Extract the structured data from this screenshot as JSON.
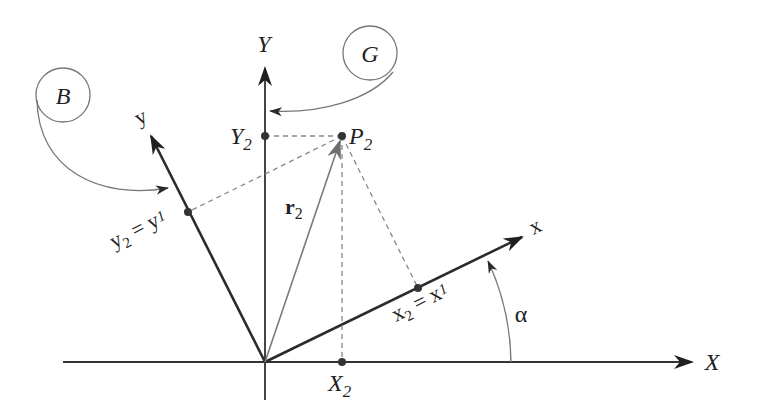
{
  "diagram": {
    "type": "rotated-coordinate-frames",
    "frames": {
      "global": {
        "label": "G",
        "x_axis": "X",
        "y_axis": "Y"
      },
      "body": {
        "label": "B",
        "x_axis": "x",
        "y_axis": "y"
      }
    },
    "point": {
      "label": "P",
      "subscript": "2",
      "vector_label": "r",
      "vector_subscript": "2"
    },
    "projections": {
      "X2": {
        "main": "X",
        "sub": "2"
      },
      "Y2": {
        "main": "Y",
        "sub": "2"
      },
      "x2_eq": {
        "text1": "x",
        "sub1": "2",
        "eq": " = ",
        "text2": "x",
        "sub2": "1"
      },
      "y2_eq": {
        "text1": "y",
        "sub1": "2",
        "eq": " = ",
        "text2": "y",
        "sub2": "1"
      }
    },
    "angle_label": "α",
    "colors": {
      "axis_dark": "#2b2b2b",
      "axis_gray": "#555555",
      "thin_gray": "#777777",
      "dashed": "#888888",
      "vector": "#7a7a7a"
    }
  }
}
